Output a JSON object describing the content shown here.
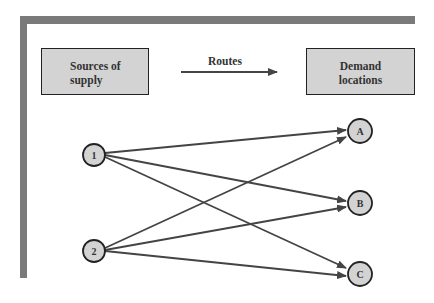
{
  "header": {
    "supply_box": {
      "line1": "Sources of",
      "line2": "supply"
    },
    "routes_label": "Routes",
    "demand_box": {
      "line1": "Demand",
      "line2": "locations"
    }
  },
  "network": {
    "sources": [
      {
        "id": "1",
        "label": "1"
      },
      {
        "id": "2",
        "label": "2"
      }
    ],
    "destinations": [
      {
        "id": "A",
        "label": "A"
      },
      {
        "id": "B",
        "label": "B"
      },
      {
        "id": "C",
        "label": "C"
      }
    ],
    "routes": [
      {
        "from": "1",
        "to": "A"
      },
      {
        "from": "1",
        "to": "B"
      },
      {
        "from": "1",
        "to": "C"
      },
      {
        "from": "2",
        "to": "A"
      },
      {
        "from": "2",
        "to": "B"
      },
      {
        "from": "2",
        "to": "C"
      }
    ]
  },
  "colors": {
    "frame": "#7a7a7a",
    "box_fill": "#d3d3d3",
    "node_fill": "#d3d3d3",
    "line": "#444444"
  }
}
